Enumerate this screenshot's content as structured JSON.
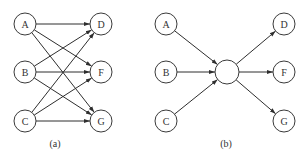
{
  "diagrams": [
    {
      "id": "a",
      "caption": "(a)",
      "caption_pos": [
        55,
        147
      ],
      "node_radius": 11,
      "nodes": [
        {
          "key": "A",
          "label": "A",
          "x": 25,
          "y": 24
        },
        {
          "key": "B",
          "label": "B",
          "x": 25,
          "y": 72
        },
        {
          "key": "C",
          "label": "C",
          "x": 25,
          "y": 121
        },
        {
          "key": "D",
          "label": "D",
          "x": 101,
          "y": 24
        },
        {
          "key": "F",
          "label": "F",
          "x": 101,
          "y": 72
        },
        {
          "key": "G",
          "label": "G",
          "x": 101,
          "y": 121
        }
      ],
      "edges": [
        [
          "A",
          "D"
        ],
        [
          "A",
          "F"
        ],
        [
          "A",
          "G"
        ],
        [
          "B",
          "D"
        ],
        [
          "B",
          "F"
        ],
        [
          "B",
          "G"
        ],
        [
          "C",
          "D"
        ],
        [
          "C",
          "F"
        ],
        [
          "C",
          "G"
        ]
      ]
    },
    {
      "id": "b",
      "caption": "(b)",
      "caption_pos": [
        226,
        147
      ],
      "node_radius": 11,
      "nodes": [
        {
          "key": "A",
          "label": "A",
          "x": 166,
          "y": 24
        },
        {
          "key": "B",
          "label": "B",
          "x": 166,
          "y": 72
        },
        {
          "key": "C",
          "label": "C",
          "x": 166,
          "y": 121
        },
        {
          "key": "H",
          "label": "",
          "x": 227,
          "y": 72,
          "r": 12
        },
        {
          "key": "D",
          "label": "D",
          "x": 284,
          "y": 24
        },
        {
          "key": "F",
          "label": "F",
          "x": 284,
          "y": 72
        },
        {
          "key": "G",
          "label": "G",
          "x": 284,
          "y": 121
        }
      ],
      "edges": [
        [
          "A",
          "H"
        ],
        [
          "B",
          "H"
        ],
        [
          "C",
          "H"
        ],
        [
          "H",
          "D"
        ],
        [
          "H",
          "F"
        ],
        [
          "H",
          "G"
        ]
      ]
    }
  ]
}
